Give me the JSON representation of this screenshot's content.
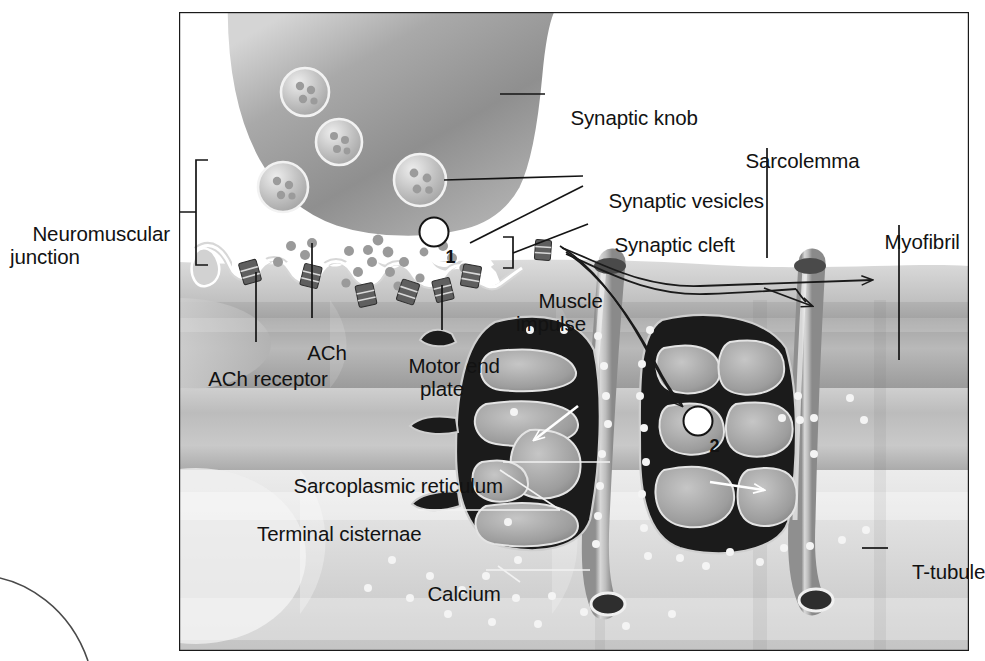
{
  "figure": {
    "type": "anatomical-illustration",
    "frame": {
      "x": 178,
      "y": 11,
      "width": 792,
      "height": 641,
      "border_color": "#1a1a1a",
      "border_width": 2
    },
    "background_color": "#ffffff"
  },
  "labels": {
    "neuromuscular_junction": "Neuromuscular\njunction",
    "ach": "ACh",
    "ach_receptor": "ACh receptor",
    "motor_end_plate": "Motor end\nplate",
    "synaptic_knob": "Synaptic knob",
    "synaptic_vesicles": "Synaptic vesicles",
    "synaptic_cleft": "Synaptic cleft",
    "muscle_impulse": "Muscle\nimpulse",
    "sarcolemma": "Sarcolemma",
    "myofibril": "Myofibril",
    "sarcoplasmic_reticulum": "Sarcoplasmic reticulum",
    "terminal_cisternae": "Terminal cisternae",
    "calcium": "Calcium",
    "t_tubule": "T-tubule"
  },
  "step_markers": [
    {
      "id": "step-1",
      "number": "1",
      "x": 434,
      "y": 232
    },
    {
      "id": "step-2",
      "number": "2",
      "x": 698,
      "y": 421
    }
  ],
  "colors": {
    "ink": "#121212",
    "frame": "#1a1a1a",
    "knob_fill_dark": "#8e8e8e",
    "knob_fill_light": "#c6c6c6",
    "knob_outline": "#ffffff",
    "cleft_white": "#ffffff",
    "muscle_mid": "#b3b3b3",
    "muscle_light": "#e3e3e3",
    "muscle_dark": "#9a9a9a",
    "sr_dark": "#1c1c1c",
    "sr_lumen": "#9e9e9e",
    "calcium_dot": "#f2f2f2",
    "receptor_gray": "#6a6a6a",
    "vesicle_fill": "#bdbdbd"
  },
  "vesicles": [
    {
      "cx": 305,
      "cy": 92,
      "r": 24
    },
    {
      "cx": 339,
      "cy": 142,
      "r": 23
    },
    {
      "cx": 283,
      "cy": 187,
      "r": 25
    },
    {
      "cx": 420,
      "cy": 180,
      "r": 26
    }
  ],
  "leader_lines": [
    {
      "name": "neuromuscular-junction-leader",
      "from": [
        152,
        212
      ],
      "to": [
        196,
        212
      ]
    },
    {
      "name": "synaptic-knob-leader",
      "from": [
        500,
        94
      ],
      "to": [
        545,
        94
      ]
    },
    {
      "name": "synaptic-vesicles-leader-upper",
      "from": [
        444,
        180
      ],
      "to": [
        583,
        176
      ]
    },
    {
      "name": "synaptic-vesicles-leader-lower",
      "from": [
        470,
        243
      ],
      "to": [
        583,
        186
      ]
    },
    {
      "name": "synaptic-cleft-leader",
      "from": [
        513,
        253
      ],
      "to": [
        588,
        224
      ]
    },
    {
      "name": "sarcolemma-leader",
      "from": [
        767,
        148
      ],
      "to": [
        767,
        258
      ]
    },
    {
      "name": "myofibril-leader",
      "from": [
        899,
        225
      ],
      "to": [
        899,
        360
      ]
    },
    {
      "name": "ach-leader",
      "from": [
        312,
        243
      ],
      "to": [
        312,
        318
      ]
    },
    {
      "name": "ach-receptor-leader",
      "from": [
        256,
        272
      ],
      "to": [
        256,
        342
      ]
    },
    {
      "name": "motor-end-plate-leader",
      "from": [
        442,
        285
      ],
      "to": [
        442,
        330
      ]
    },
    {
      "name": "sarcoplasmic-reticulum-leader",
      "from": [
        503,
        462
      ],
      "to": [
        610,
        462
      ]
    },
    {
      "name": "terminal-cisternae-leader",
      "from": [
        418,
        510
      ],
      "to": [
        560,
        510
      ]
    },
    {
      "name": "calcium-leader",
      "from": [
        486,
        570
      ],
      "to": [
        590,
        570
      ]
    },
    {
      "name": "t-tubule-leader",
      "from": [
        862,
        548
      ],
      "to": [
        888,
        548
      ]
    }
  ],
  "brackets": [
    {
      "name": "neuromuscular-junction-bracket",
      "x": 196,
      "top": 160,
      "bottom": 265,
      "tick": 12
    },
    {
      "name": "synaptic-cleft-bracket",
      "x": 513,
      "top": 237,
      "bottom": 268,
      "tick": 10
    }
  ],
  "arrows": [
    {
      "name": "muscle-impulse-arrow-right",
      "description": "impulse travelling right along sarcolemma"
    },
    {
      "name": "muscle-impulse-arrow-branch",
      "description": "impulse branching down into T-tubule"
    },
    {
      "name": "muscle-impulse-arrow-into-t-tubule",
      "description": "impulse entering T-tubule at step 2"
    },
    {
      "name": "calcium-release-arrow-left",
      "description": "calcium released from terminal cisterna (left)"
    },
    {
      "name": "calcium-release-arrow-right",
      "description": "calcium released from terminal cisterna (right)"
    }
  ]
}
